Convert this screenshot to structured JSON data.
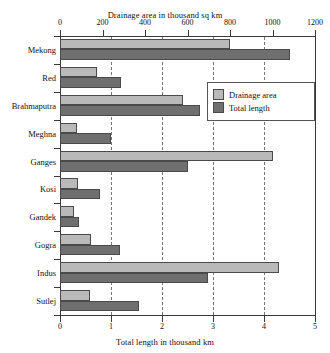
{
  "chart_data": {
    "type": "bar",
    "orientation": "horizontal",
    "title": "",
    "categories": [
      "Mekong",
      "Red",
      "Brahmaputra",
      "Meghna",
      "Ganges",
      "Kosi",
      "Gandek",
      "Gogra",
      "Indus",
      "Sutlej"
    ],
    "series": [
      {
        "name": "Drainage area",
        "axis": "top",
        "unit": "thousand sq km",
        "color": "#b9b9b9",
        "values": [
          800,
          175,
          580,
          80,
          1000,
          85,
          65,
          145,
          1030,
          140
        ]
      },
      {
        "name": "Total length",
        "axis": "bottom",
        "unit": "thousand km",
        "color": "#6f6f6f",
        "values": [
          4.5,
          1.2,
          2.75,
          1.0,
          2.5,
          0.78,
          0.38,
          1.18,
          2.9,
          1.55
        ]
      }
    ],
    "top_axis": {
      "label": "Drainage area in thousand sq km",
      "ticks": [
        "0",
        "200",
        "400",
        "600",
        "800",
        "1000",
        "1200"
      ],
      "min": 0,
      "max": 1200
    },
    "bottom_axis": {
      "label": "Total length in thousand km",
      "ticks": [
        "0",
        "1",
        "2",
        "3",
        "4",
        "5"
      ],
      "min": 0,
      "max": 5
    },
    "grid": true,
    "legend_position": "top-right",
    "legend": [
      "Drainage area",
      "Total length"
    ]
  }
}
